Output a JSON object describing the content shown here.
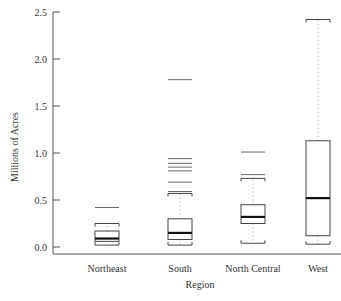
{
  "chart_data": {
    "type": "boxplot",
    "title": "",
    "xlabel": "Region",
    "ylabel": "Millions of Acres",
    "ylim": [
      0.0,
      2.5
    ],
    "yticks": [
      0.0,
      0.5,
      1.0,
      1.5,
      2.0,
      2.5
    ],
    "ytick_labels": [
      "0.0",
      "0.5",
      "1.0",
      "1.5",
      "2.0",
      "2.5"
    ],
    "grid": false,
    "legend": null,
    "categories": [
      "Northeast",
      "South",
      "North Central",
      "West"
    ],
    "boxes": [
      {
        "name": "Northeast",
        "whisker_low": 0.02,
        "q1": 0.06,
        "median": 0.09,
        "q3": 0.17,
        "whisker_high": 0.25,
        "outliers": [
          0.42
        ]
      },
      {
        "name": "South",
        "whisker_low": 0.02,
        "q1": 0.08,
        "median": 0.15,
        "q3": 0.3,
        "whisker_high": 0.57,
        "outliers": [
          0.59,
          0.69,
          0.81,
          0.85,
          0.89,
          0.94,
          1.78
        ]
      },
      {
        "name": "North Central",
        "whisker_low": 0.04,
        "q1": 0.25,
        "median": 0.32,
        "q3": 0.45,
        "whisker_high": 0.73,
        "outliers": [
          0.77,
          1.01
        ]
      },
      {
        "name": "West",
        "whisker_low": 0.03,
        "q1": 0.12,
        "median": 0.52,
        "q3": 1.13,
        "whisker_high": 2.42,
        "outliers": []
      }
    ]
  },
  "colors": {
    "axis": "#555555",
    "box": "#444444",
    "median": "#111111",
    "whisker": "#999999",
    "outlier": "#666666"
  }
}
